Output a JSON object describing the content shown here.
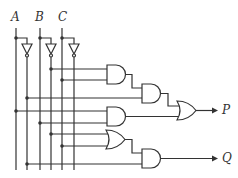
{
  "diagram": {
    "type": "logic-circuit",
    "inputs": [
      {
        "label": "A",
        "x": 16
      },
      {
        "label": "B",
        "x": 40
      },
      {
        "label": "C",
        "x": 62
      }
    ],
    "outputs": [
      {
        "label": "P"
      },
      {
        "label": "Q"
      }
    ],
    "colors": {
      "line": "#333333",
      "background": "#ffffff"
    }
  }
}
